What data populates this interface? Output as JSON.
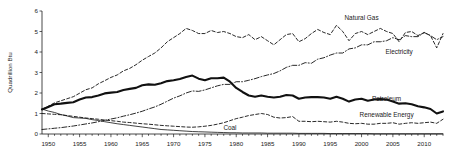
{
  "chart_data": {
    "type": "line",
    "title": "",
    "xlabel": "",
    "ylabel": "Quadrillion Btu",
    "xlim": [
      1949,
      2013
    ],
    "ylim": [
      0,
      6
    ],
    "grid": false,
    "legend_position": "inline-annotations",
    "y_ticks": [
      "0",
      "1",
      "2",
      "3",
      "4",
      "5",
      "6"
    ],
    "x_ticks": [
      "1950",
      "1955",
      "1960",
      "1965",
      "1970",
      "1975",
      "1980",
      "1985",
      "1990",
      "1995",
      "2000",
      "2005",
      "2010"
    ],
    "x": [
      1949,
      1950,
      1951,
      1952,
      1953,
      1954,
      1955,
      1956,
      1957,
      1958,
      1959,
      1960,
      1961,
      1962,
      1963,
      1964,
      1965,
      1966,
      1967,
      1968,
      1969,
      1970,
      1971,
      1972,
      1973,
      1974,
      1975,
      1976,
      1977,
      1978,
      1979,
      1980,
      1981,
      1982,
      1983,
      1984,
      1985,
      1986,
      1987,
      1988,
      1989,
      1990,
      1991,
      1992,
      1993,
      1994,
      1995,
      1996,
      1997,
      1998,
      1999,
      2000,
      2001,
      2002,
      2003,
      2004,
      2005,
      2006,
      2007,
      2008,
      2009,
      2010,
      2011,
      2012,
      2013
    ],
    "series": [
      {
        "name": "Natural Gas",
        "style": "dashed",
        "label_x": 2000,
        "label_y": 5.55,
        "values": [
          1.2,
          1.36,
          1.52,
          1.62,
          1.72,
          1.82,
          1.99,
          2.16,
          2.25,
          2.45,
          2.6,
          2.76,
          2.88,
          3.08,
          3.2,
          3.38,
          3.6,
          3.78,
          3.95,
          4.2,
          4.5,
          4.7,
          4.9,
          5.15,
          5.05,
          4.9,
          4.9,
          5.05,
          4.95,
          5.0,
          4.9,
          4.75,
          4.7,
          4.85,
          4.6,
          4.75,
          4.55,
          4.35,
          4.6,
          4.85,
          4.9,
          4.5,
          4.65,
          4.9,
          5.1,
          4.95,
          4.85,
          5.3,
          5.0,
          4.55,
          4.9,
          5.0,
          4.85,
          5.0,
          5.15,
          5.0,
          4.9,
          4.5,
          4.95,
          5.0,
          4.8,
          4.95,
          4.8,
          4.2,
          4.9
        ]
      },
      {
        "name": "Electricity",
        "style": "dash-dot",
        "label_x": 2006,
        "label_y": 3.9,
        "values": [
          0.22,
          0.25,
          0.28,
          0.31,
          0.35,
          0.39,
          0.44,
          0.49,
          0.54,
          0.6,
          0.67,
          0.73,
          0.79,
          0.87,
          0.94,
          1.02,
          1.11,
          1.22,
          1.32,
          1.45,
          1.6,
          1.75,
          1.86,
          2.0,
          2.1,
          2.08,
          2.15,
          2.25,
          2.35,
          2.42,
          2.42,
          2.55,
          2.55,
          2.62,
          2.7,
          2.8,
          2.88,
          2.95,
          3.08,
          3.25,
          3.35,
          3.35,
          3.48,
          3.45,
          3.65,
          3.72,
          3.85,
          3.95,
          3.95,
          4.15,
          4.2,
          4.35,
          4.35,
          4.5,
          4.5,
          4.55,
          4.7,
          4.6,
          4.8,
          4.75,
          4.75,
          4.95,
          4.8,
          4.6,
          4.75
        ]
      },
      {
        "name": "Petroleum",
        "style": "thick-solid",
        "label_x": 2004,
        "label_y": 1.62,
        "values": [
          1.2,
          1.32,
          1.45,
          1.48,
          1.52,
          1.55,
          1.68,
          1.78,
          1.8,
          1.88,
          1.98,
          2.02,
          2.05,
          2.15,
          2.2,
          2.25,
          2.38,
          2.42,
          2.4,
          2.48,
          2.58,
          2.62,
          2.68,
          2.78,
          2.85,
          2.7,
          2.62,
          2.72,
          2.72,
          2.75,
          2.55,
          2.25,
          2.05,
          1.88,
          1.82,
          1.88,
          1.82,
          1.78,
          1.82,
          1.9,
          1.88,
          1.72,
          1.78,
          1.8,
          1.8,
          1.78,
          1.72,
          1.82,
          1.72,
          1.58,
          1.68,
          1.72,
          1.62,
          1.68,
          1.7,
          1.68,
          1.58,
          1.48,
          1.5,
          1.45,
          1.35,
          1.3,
          1.22,
          1.0,
          1.1
        ]
      },
      {
        "name": "Renewable Energy",
        "style": "dashed",
        "label_x": 2004,
        "label_y": 0.85,
        "values": [
          1.0,
          0.98,
          0.96,
          0.94,
          0.9,
          0.86,
          0.82,
          0.78,
          0.75,
          0.72,
          0.68,
          0.65,
          0.62,
          0.58,
          0.56,
          0.53,
          0.5,
          0.48,
          0.45,
          0.42,
          0.4,
          0.38,
          0.36,
          0.34,
          0.33,
          0.35,
          0.38,
          0.42,
          0.48,
          0.55,
          0.65,
          0.75,
          0.82,
          0.9,
          0.95,
          1.0,
          0.95,
          0.82,
          0.78,
          0.8,
          0.85,
          0.62,
          0.62,
          0.6,
          0.62,
          0.6,
          0.58,
          0.62,
          0.58,
          0.52,
          0.5,
          0.52,
          0.48,
          0.48,
          0.52,
          0.52,
          0.55,
          0.48,
          0.52,
          0.55,
          0.52,
          0.55,
          0.58,
          0.52,
          0.72
        ]
      },
      {
        "name": "Coal",
        "style": "thin-solid",
        "label_x": 1979,
        "label_y": 0.18,
        "values": [
          1.22,
          1.12,
          1.05,
          0.95,
          0.88,
          0.8,
          0.78,
          0.76,
          0.7,
          0.66,
          0.6,
          0.55,
          0.5,
          0.46,
          0.42,
          0.38,
          0.34,
          0.3,
          0.26,
          0.22,
          0.2,
          0.18,
          0.16,
          0.14,
          0.12,
          0.11,
          0.1,
          0.09,
          0.08,
          0.07,
          0.06,
          0.06,
          0.05,
          0.05,
          0.05,
          0.05,
          0.04,
          0.04,
          0.04,
          0.04,
          0.04,
          0.03,
          0.03,
          0.03,
          0.03,
          0.03,
          0.02,
          0.02,
          0.02,
          0.02,
          0.02,
          0.02,
          0.02,
          0.01,
          0.01,
          0.01,
          0.01,
          0.01,
          0.01,
          0.01,
          0.01,
          0.01,
          0.01,
          0.01,
          0.01
        ]
      }
    ]
  }
}
